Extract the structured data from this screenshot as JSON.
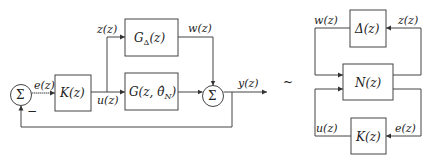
{
  "left_diagram": {
    "sum_left": {
      "symbol": "Σ",
      "minus_sign": "−"
    },
    "controller": {
      "label": "K(z)"
    },
    "uncertainty_block": {
      "label": "G",
      "subscript": "Δ",
      "arg": "(z)"
    },
    "plant": {
      "label": "G(z, θ̂",
      "subscript": "N",
      "close": ")"
    },
    "sum_right": {
      "symbol": "Σ"
    },
    "signals": {
      "e": "e(z)",
      "u": "u(z)",
      "z": "z(z)",
      "w": "w(z)",
      "y": "y(z)"
    }
  },
  "equivalence_symbol": "~",
  "right_diagram": {
    "delta_block": {
      "label": "Δ(z)"
    },
    "n_block": {
      "label": "N(z)"
    },
    "k_block": {
      "label": "K(z)"
    },
    "signals": {
      "w": "w(z)",
      "z": "z(z)",
      "u": "u(z)",
      "e": "e(z)"
    }
  }
}
